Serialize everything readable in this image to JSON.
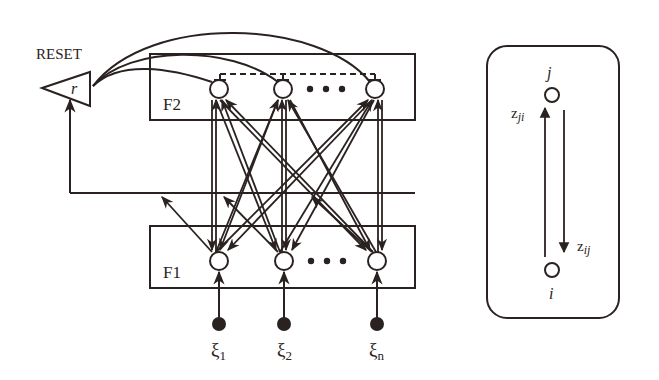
{
  "diagram": {
    "type": "ART neural network architecture",
    "colors": {
      "ink": "#2a2220",
      "background": "#ffffff"
    },
    "reset": {
      "label": "RESET",
      "node_symbol": "r"
    },
    "layers": {
      "f2": {
        "label": "F2",
        "node_count_visible": 3,
        "ellipsis": "• • •"
      },
      "f1": {
        "label": "F1",
        "node_count_visible": 3,
        "ellipsis": "• • •"
      }
    },
    "inputs": [
      {
        "symbol": "ξ",
        "subscript": "1"
      },
      {
        "symbol": "ξ",
        "subscript": "2"
      },
      {
        "symbol": "ξ",
        "subscript": "n"
      }
    ],
    "inset": {
      "top_node": "j",
      "bottom_node": "i",
      "up_weight": {
        "symbol": "z",
        "subscript": "ji"
      },
      "down_weight": {
        "symbol": "z",
        "subscript": "ij"
      }
    }
  }
}
